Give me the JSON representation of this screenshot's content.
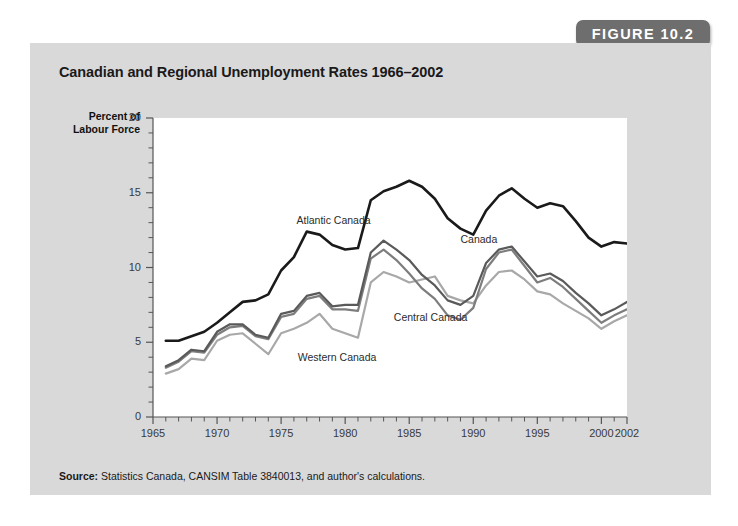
{
  "figure": {
    "badge_label": "FIGURE 10.2",
    "title": "Canadian and Regional Unemployment Rates 1966–2002",
    "source_prefix": "Source:",
    "source_text": " Statistics Canada, CANSIM Table 3840013, and author's calculations."
  },
  "colors": {
    "panel_background": "#d9d9d9",
    "plot_background": "#ffffff",
    "badge_background": "#6e6e6e",
    "badge_text": "#ffffff",
    "atlantic": "#1a1a1a",
    "canada": "#5a5a5a",
    "central": "#7d7d7d",
    "western": "#a8a8a8",
    "axis": "#555555"
  },
  "chart_data": {
    "type": "line",
    "title": "Canadian and Regional Unemployment Rates 1966–2002",
    "xlabel": "",
    "ylabel": "Percent of Labour Force",
    "ylabel_line1": "Percent of",
    "ylabel_line2": "Labour Force",
    "xlim": [
      1965,
      2002
    ],
    "ylim": [
      0,
      20
    ],
    "yticks": [
      0,
      5,
      10,
      15,
      20
    ],
    "ytick_labels": [
      "0",
      "5",
      "10",
      "15",
      "20"
    ],
    "y_minor_step": 1,
    "xticks": [
      1965,
      1970,
      1975,
      1980,
      1985,
      1990,
      1995,
      2000,
      2002
    ],
    "xtick_labels": [
      "1965",
      "1970",
      "1975",
      "1980",
      "1985",
      "1990",
      "1995",
      "2000",
      "2002"
    ],
    "x_minor_step": 1,
    "grid": false,
    "legend": "inline-labels",
    "x": [
      1966,
      1967,
      1968,
      1969,
      1970,
      1971,
      1972,
      1973,
      1974,
      1975,
      1976,
      1977,
      1978,
      1979,
      1980,
      1981,
      1982,
      1983,
      1984,
      1985,
      1986,
      1987,
      1988,
      1989,
      1990,
      1991,
      1992,
      1993,
      1994,
      1995,
      1996,
      1997,
      1998,
      1999,
      2000,
      2001,
      2002
    ],
    "series": [
      {
        "name": "Atlantic Canada",
        "color": "#1a1a1a",
        "label_x": 1976.2,
        "label_y": 13.6,
        "values": [
          5.1,
          5.1,
          5.4,
          5.7,
          6.3,
          7.0,
          7.7,
          7.8,
          8.2,
          9.8,
          10.7,
          12.4,
          12.2,
          11.5,
          11.2,
          11.3,
          14.5,
          15.1,
          15.4,
          15.8,
          15.4,
          14.6,
          13.3,
          12.6,
          12.2,
          13.8,
          14.8,
          15.3,
          14.6,
          14.0,
          14.3,
          14.1,
          13.1,
          12.0,
          11.4,
          11.7,
          11.6
        ]
      },
      {
        "name": "Canada",
        "color": "#5a5a5a",
        "label_x": 1989.0,
        "label_y": 12.3,
        "values": [
          3.4,
          3.8,
          4.5,
          4.4,
          5.7,
          6.2,
          6.2,
          5.5,
          5.3,
          6.9,
          7.1,
          8.1,
          8.3,
          7.4,
          7.5,
          7.5,
          11.0,
          11.8,
          11.2,
          10.5,
          9.5,
          8.8,
          7.8,
          7.5,
          8.1,
          10.3,
          11.2,
          11.4,
          10.4,
          9.4,
          9.6,
          9.1,
          8.3,
          7.6,
          6.8,
          7.2,
          7.7
        ]
      },
      {
        "name": "Central Canada",
        "color": "#7d7d7d",
        "label_x": 1983.8,
        "label_y": 7.1,
        "values": [
          3.3,
          3.7,
          4.4,
          4.3,
          5.5,
          6.0,
          6.1,
          5.4,
          5.2,
          6.7,
          6.9,
          7.9,
          8.1,
          7.2,
          7.2,
          7.1,
          10.6,
          11.2,
          10.5,
          9.6,
          8.6,
          7.9,
          6.8,
          6.5,
          7.3,
          9.9,
          11.0,
          11.2,
          10.1,
          9.0,
          9.3,
          8.7,
          7.9,
          7.1,
          6.3,
          6.8,
          7.2
        ]
      },
      {
        "name": "Western Canada",
        "color": "#a8a8a8",
        "label_x": 1976.3,
        "label_y": 4.4,
        "values": [
          2.9,
          3.2,
          3.9,
          3.8,
          5.1,
          5.5,
          5.6,
          4.9,
          4.2,
          5.6,
          5.9,
          6.3,
          6.9,
          5.9,
          5.6,
          5.3,
          9.0,
          9.7,
          9.4,
          9.0,
          9.2,
          9.4,
          8.1,
          7.8,
          7.6,
          8.8,
          9.7,
          9.8,
          9.2,
          8.4,
          8.2,
          7.6,
          7.1,
          6.6,
          5.9,
          6.4,
          6.8
        ]
      }
    ]
  }
}
